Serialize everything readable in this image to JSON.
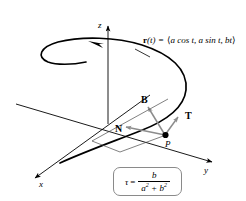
{
  "figure": {
    "name": "helix-frenet-frame-diagram",
    "background_color": "#ffffff",
    "curve_color": "#000000",
    "axis_color": "#000000",
    "vector_color": "#8c8c8c",
    "box_border_color": "#8a8a8a"
  },
  "axes": {
    "x_label": "x",
    "y_label": "y",
    "z_label": "z"
  },
  "equation": {
    "lhs_vector": "r",
    "lhs_arg": "(t)",
    "equals": "=",
    "open_bracket": "⟨",
    "component_1": "a cos t",
    "comma_1": ",",
    "component_2": "a sin t",
    "comma_2": ",",
    "component_3": "bt",
    "close_bracket": "⟩",
    "full_text": "r(t) = ⟨a cos t, a sin t, bt⟩"
  },
  "vectors": {
    "tangent_label": "T",
    "normal_label": "N",
    "binormal_label": "B"
  },
  "point": {
    "label": "P"
  },
  "formula": {
    "symbol": "τ",
    "equals": "=",
    "numerator": "b",
    "denominator_a": "a",
    "denominator_a_exp": "2",
    "denominator_plus": "+",
    "denominator_b": "b",
    "denominator_b_exp": "2",
    "full_text": "τ = b / (a² + b²)"
  }
}
